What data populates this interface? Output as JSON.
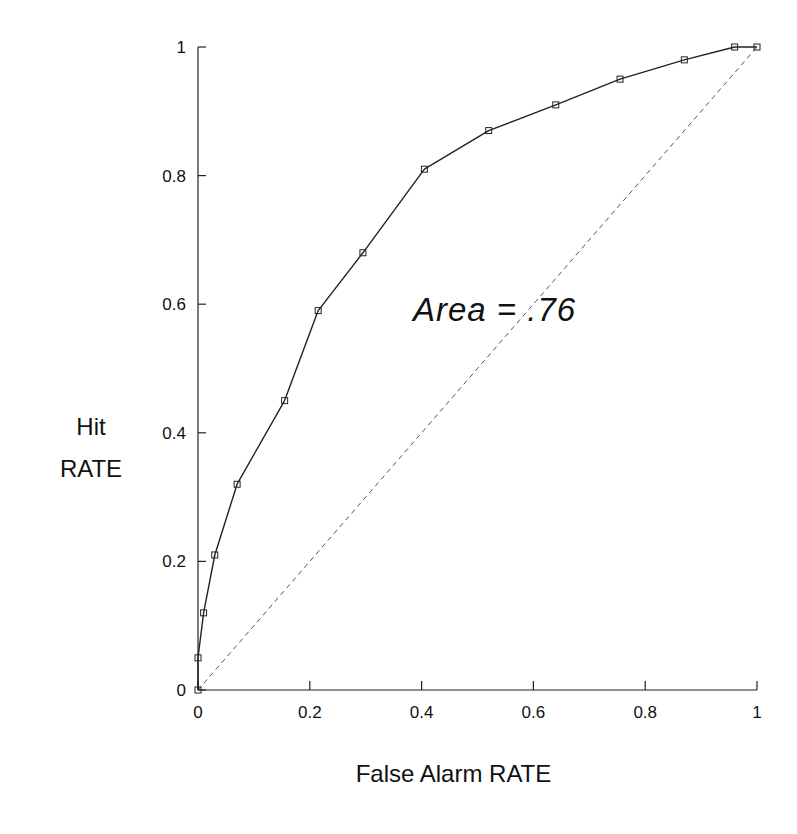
{
  "chart_data": {
    "type": "line",
    "title": "",
    "xlabel": "False Alarm RATE",
    "ylabel": [
      "Hit",
      "RATE"
    ],
    "xlim": [
      0,
      1
    ],
    "ylim": [
      0,
      1
    ],
    "xticks": [
      0,
      0.2,
      0.4,
      0.6,
      0.8,
      1
    ],
    "xtick_labels": [
      "0",
      "0.2",
      "0.4",
      "0.6",
      "0.8",
      "1"
    ],
    "yticks": [
      0,
      0.2,
      0.4,
      0.6,
      0.8,
      1
    ],
    "ytick_labels": [
      "0",
      "0.2",
      "0.4",
      "0.6",
      "0.8",
      "1"
    ],
    "grid": false,
    "legend": null,
    "annotation": "Area = .76",
    "series": [
      {
        "name": "ROC curve",
        "style": "solid line with square markers",
        "x": [
          0,
          0,
          0.01,
          0.03,
          0.07,
          0.155,
          0.215,
          0.295,
          0.405,
          0.52,
          0.64,
          0.755,
          0.87,
          0.96,
          1.0
        ],
        "y": [
          0,
          0.05,
          0.12,
          0.21,
          0.32,
          0.45,
          0.59,
          0.68,
          0.81,
          0.87,
          0.91,
          0.95,
          0.98,
          1.0,
          1.0
        ]
      },
      {
        "name": "chance diagonal",
        "style": "dashed line",
        "x": [
          0,
          1
        ],
        "y": [
          0,
          1
        ]
      }
    ]
  },
  "labels": {
    "y_line1": "Hit",
    "y_line2": "RATE",
    "x": "False Alarm RATE",
    "annotation": "Area = .76"
  },
  "colors": {
    "line": "#222222",
    "dashed": "#555555",
    "background": "#ffffff"
  }
}
